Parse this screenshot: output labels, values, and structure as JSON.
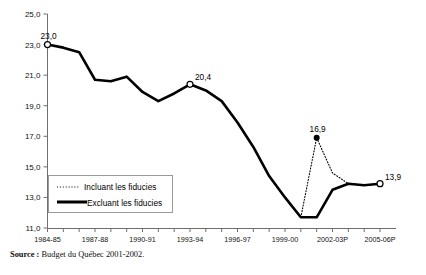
{
  "source_note": {
    "label": "Source :",
    "text": "Budget du Québec 2001-2002."
  },
  "legend": {
    "items": [
      {
        "label": "Incluant les fiducies",
        "style": "dotted"
      },
      {
        "label": "Excluant les fiducies",
        "style": "solid"
      }
    ]
  },
  "chart_data": {
    "type": "line",
    "title": "",
    "xlabel": "",
    "ylabel": "",
    "ylim": [
      11.0,
      25.0
    ],
    "yticks": [
      "11,0",
      "13,0",
      "15,0",
      "17,0",
      "19,0",
      "21,0",
      "23,0",
      "25,0"
    ],
    "ytick_values": [
      11.0,
      13.0,
      15.0,
      17.0,
      19.0,
      21.0,
      23.0,
      25.0
    ],
    "grid": false,
    "legend_position": "inside-lower-left",
    "x": [
      "1984-85",
      "1985-86",
      "1986-87",
      "1987-88",
      "1988-89",
      "1989-90",
      "1990-91",
      "1991-92",
      "1992-93",
      "1993-94",
      "1994-95",
      "1995-96",
      "1996-97",
      "1997-98",
      "1998-99",
      "1999-00",
      "2000-01",
      "2001-02P",
      "2002-03P",
      "2003-04P",
      "2004-05P",
      "2005-06P"
    ],
    "xtick_labels": [
      "1984-85",
      "1987-88",
      "1990-91",
      "1993-94",
      "1996-97",
      "1999-00",
      "2002-03P",
      "2005-06P"
    ],
    "xtick_indices": [
      0,
      3,
      6,
      9,
      12,
      15,
      18,
      21
    ],
    "series": [
      {
        "name": "Excluant les fiducies",
        "style": "solid",
        "values": [
          23.0,
          22.8,
          22.5,
          20.7,
          20.6,
          20.9,
          19.9,
          19.3,
          19.8,
          20.4,
          20.0,
          19.3,
          17.9,
          16.3,
          14.4,
          13.0,
          11.7,
          11.7,
          13.5,
          13.9,
          13.8,
          13.9
        ]
      },
      {
        "name": "Incluant les fiducies",
        "style": "dotted",
        "values": [
          null,
          null,
          null,
          null,
          null,
          null,
          null,
          null,
          null,
          null,
          null,
          null,
          null,
          null,
          null,
          null,
          11.7,
          16.9,
          14.6,
          13.9,
          13.8,
          13.9
        ]
      }
    ],
    "point_labels": [
      {
        "text": "23,0",
        "x_index": 0,
        "value": 23.0,
        "marker": "open"
      },
      {
        "text": "20,4",
        "x_index": 9,
        "value": 20.4,
        "marker": "open"
      },
      {
        "text": "16,9",
        "x_index": 17,
        "value": 16.9,
        "marker": "filled"
      },
      {
        "text": "13,9",
        "x_index": 21,
        "value": 13.9,
        "marker": "open"
      }
    ]
  }
}
